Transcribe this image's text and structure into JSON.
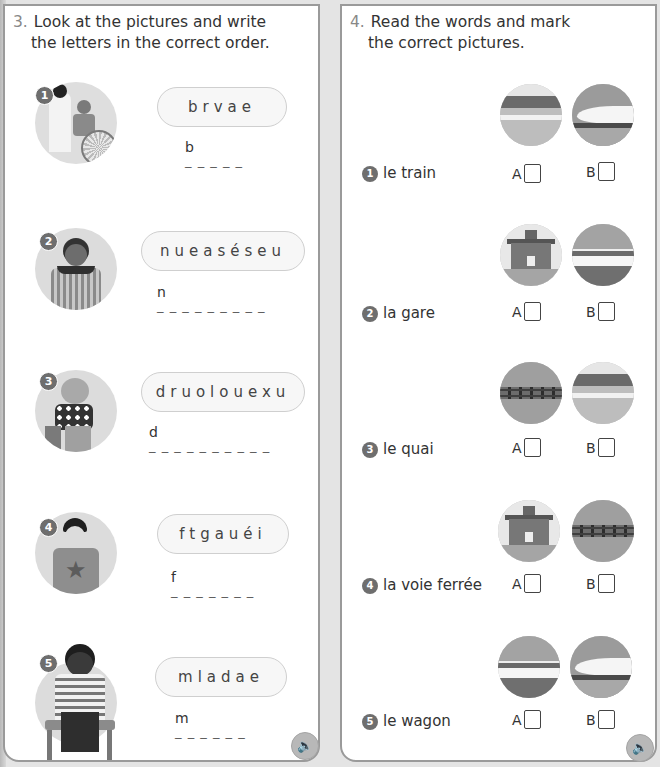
{
  "exercise3": {
    "number": "3.",
    "title_line1": "Look at the pictures and write",
    "title_line2": "the letters in the correct order.",
    "items": [
      {
        "badge": "1",
        "scrambled": "brvae",
        "first_letter": "b",
        "dashes": "_ _ _ _ _",
        "picture": "doctor-with-child-in-wheelchair"
      },
      {
        "badge": "2",
        "scrambled": "nueaséseu",
        "first_letter": "n",
        "dashes": "_ _ _ _ _ _ _ _ _",
        "picture": "girl-feeling-sick"
      },
      {
        "badge": "3",
        "scrambled": "druolouexu",
        "first_letter": "d",
        "dashes": "_ _ _ _ _ _ _ _ _ _",
        "picture": "girl-in-pain"
      },
      {
        "badge": "4",
        "scrambled": "ftgauéi",
        "first_letter": "f",
        "dashes": "_ _ _ _ _ _ _",
        "picture": "boy-yawning"
      },
      {
        "badge": "5",
        "scrambled": "mladae",
        "first_letter": "m",
        "dashes": "_ _ _ _ _ _",
        "picture": "boy-with-thermometer"
      }
    ],
    "audio_icon": "speaker-icon"
  },
  "exercise4": {
    "number": "4.",
    "title_line1": "Read the words and mark",
    "title_line2": "the correct pictures.",
    "option_a": "A",
    "option_b": "B",
    "items": [
      {
        "badge": "1",
        "word": "le train",
        "picture_a": "platform",
        "picture_b": "high-speed-train"
      },
      {
        "badge": "2",
        "word": "la gare",
        "picture_a": "station-building",
        "picture_b": "wagon"
      },
      {
        "badge": "3",
        "word": "le quai",
        "picture_a": "railway-track",
        "picture_b": "platform"
      },
      {
        "badge": "4",
        "word": "la voie ferrée",
        "picture_a": "station-building",
        "picture_b": "railway-track"
      },
      {
        "badge": "5",
        "word": "le wagon",
        "picture_a": "wagon",
        "picture_b": "high-speed-train"
      }
    ],
    "audio_icon": "speaker-icon"
  },
  "colors": {
    "badge": "#6e6e6e",
    "border": "#9a9a9a",
    "pill_bg": "#f7f7f7",
    "page_bg": "#e4e4e4"
  }
}
